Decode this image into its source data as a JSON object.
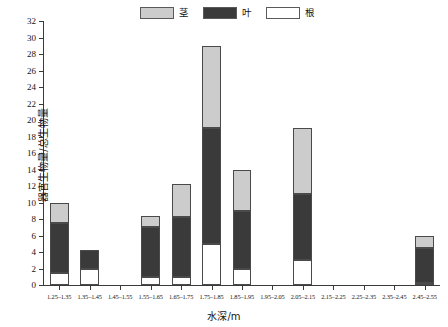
{
  "chart_data": {
    "type": "bar",
    "title": "",
    "subtitle": "",
    "stacked": true,
    "xlabel": "水深/m",
    "ylabel": "器官生物量/总生物量",
    "ylim": [
      0,
      32
    ],
    "ytick_step": 2,
    "grid": false,
    "legend_position": "top-center",
    "categories": [
      "1.25–1.35",
      "1.35–1.45",
      "1.45–1.55",
      "1.55–1.65",
      "1.65–1.75",
      "1.75–1.85",
      "1.85–1.95",
      "1.95–2.05",
      "2.05–2.15",
      "2.15–2.25",
      "2.25–2.35",
      "2.35–2.45",
      "2.45–2.55"
    ],
    "ytick_labels": [
      "0",
      "2",
      "4",
      "6",
      "8",
      "10",
      "12",
      "14",
      "16",
      "18",
      "20",
      "22",
      "24",
      "26",
      "28",
      "30",
      "32"
    ],
    "series": [
      {
        "name": "根",
        "color": "#ffffff",
        "values": [
          1.5,
          2.0,
          0,
          1.0,
          1.0,
          5.0,
          2.0,
          0,
          3.0,
          0,
          0,
          0,
          0.2
        ]
      },
      {
        "name": "叶",
        "color": "#3a3a3a",
        "values": [
          6.0,
          2.2,
          0,
          6.0,
          7.2,
          14.0,
          7.0,
          0,
          8.0,
          0,
          0,
          0,
          4.3
        ]
      },
      {
        "name": "茎",
        "color": "#cccccc",
        "values": [
          2.4,
          0,
          0,
          1.4,
          4.0,
          10.0,
          5.0,
          0,
          8.0,
          0,
          0,
          0,
          1.5
        ]
      }
    ],
    "totals": [
      9.9,
      4.2,
      0,
      8.4,
      12.2,
      29.0,
      14.0,
      0,
      19.0,
      0,
      0,
      0,
      6.0
    ]
  },
  "legend": {
    "items": [
      {
        "label": "茎",
        "color": "#cccccc"
      },
      {
        "label": "叶",
        "color": "#3a3a3a"
      },
      {
        "label": "根",
        "color": "#ffffff"
      }
    ]
  },
  "axes": {
    "x_title": "水深/m",
    "y_title": "器官生物量/总生物量"
  }
}
